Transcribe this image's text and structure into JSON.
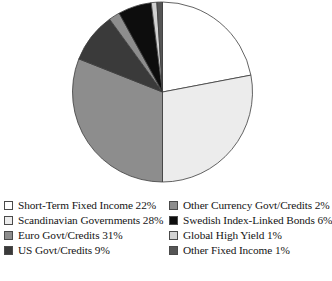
{
  "chart_data": {
    "type": "pie",
    "title": "",
    "subtitle": "",
    "xlabel": "",
    "ylabel": "",
    "grid": false,
    "legend_position": "bottom",
    "legend_columns": 2,
    "start_angle_deg": 0,
    "direction": "clockwise",
    "units": "percent",
    "total": 100,
    "categories": [
      "Short-Term Fixed Income",
      "Scandinavian Governments",
      "Euro Govt/Credits",
      "US Govt/Credits",
      "Other Currency Govt/Credits",
      "Swedish Index-Linked Bonds",
      "Global High Yield",
      "Other Fixed Income"
    ],
    "values": [
      22,
      28,
      31,
      9,
      2,
      6,
      1,
      1
    ],
    "colors": [
      "#ffffff",
      "#ececec",
      "#8d8d8d",
      "#3a3a3a",
      "#8d8d8d",
      "#0d0d0d",
      "#d2d2d2",
      "#555555"
    ],
    "slice_border_color": "#3c3c3c",
    "slices": [
      {
        "label": "Short-Term Fixed Income",
        "value": 22,
        "value_text": "22%",
        "color": "#ffffff"
      },
      {
        "label": "Scandinavian Governments",
        "value": 28,
        "value_text": "28%",
        "color": "#ececec"
      },
      {
        "label": "Euro Govt/Credits",
        "value": 31,
        "value_text": "31%",
        "color": "#8d8d8d"
      },
      {
        "label": "US Govt/Credits",
        "value": 9,
        "value_text": "9%",
        "color": "#3a3a3a"
      },
      {
        "label": "Other Currency Govt/Credits",
        "value": 2,
        "value_text": "2%",
        "color": "#8d8d8d"
      },
      {
        "label": "Swedish Index-Linked Bonds",
        "value": 6,
        "value_text": "6%",
        "color": "#0d0d0d"
      },
      {
        "label": "Global High Yield",
        "value": 1,
        "value_text": "1%",
        "color": "#d2d2d2"
      },
      {
        "label": "Other Fixed Income",
        "value": 1,
        "value_text": "1%",
        "color": "#555555"
      }
    ]
  },
  "legend": {
    "left_column": [
      {
        "text": "Short-Term Fixed Income 22%",
        "color": "#ffffff"
      },
      {
        "text": "Scandinavian Governments 28%",
        "color": "#ececec"
      },
      {
        "text": "Euro Govt/Credits 31%",
        "color": "#8d8d8d"
      },
      {
        "text": "US Govt/Credits 9%",
        "color": "#3a3a3a"
      }
    ],
    "right_column": [
      {
        "text": "Other Currency Govt/Credits 2%",
        "color": "#8d8d8d"
      },
      {
        "text": "Swedish Index-Linked Bonds 6%",
        "color": "#0d0d0d"
      },
      {
        "text": "Global High Yield 1%",
        "color": "#d2d2d2"
      },
      {
        "text": "Other Fixed Income 1%",
        "color": "#555555"
      }
    ]
  }
}
